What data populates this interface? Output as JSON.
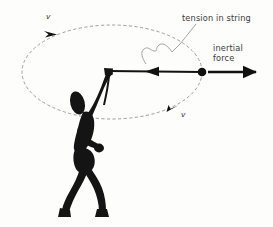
{
  "figure": {
    "background_color": "#fdfdfc",
    "ink_color": "#111111",
    "guide_color": "#8d8d8a",
    "text_color": "#3a3a38"
  },
  "labels": {
    "tension": "tension in string",
    "inertial_line1": "inertial",
    "inertial_line2": "force",
    "velocity_top": "v",
    "velocity_bottom": "v"
  },
  "annotations": {
    "orbit": {
      "shape": "ellipse",
      "center_x": 112,
      "center_y": 72,
      "radius_x": 90,
      "radius_y": 47,
      "style": "dashed"
    },
    "ball": {
      "center_x": 202,
      "center_y": 72,
      "radius": 4.2
    },
    "hand": {
      "x": 108,
      "y": 71
    },
    "string": {
      "from_x": 108,
      "from_y": 71,
      "to_x": 202,
      "to_y": 72,
      "arrow_x": 154,
      "arrow_direction": "left"
    },
    "inertial_force_arrow": {
      "from_x": 208,
      "from_y": 72,
      "to_x": 263,
      "to_y": 72,
      "direction": "right"
    },
    "velocity_arrow_top": {
      "x": 50,
      "y": 31,
      "direction": "counterclockwise-left"
    },
    "velocity_arrow_bottom": {
      "x": 173,
      "y": 110,
      "direction": "clockwise-right"
    }
  }
}
